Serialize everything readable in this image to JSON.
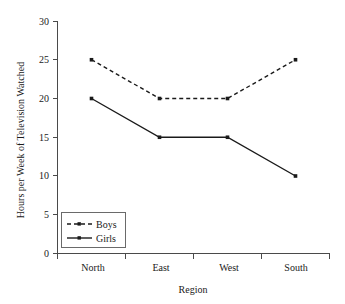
{
  "chart_data": {
    "type": "line",
    "title": "",
    "xlabel": "Region",
    "ylabel": "Hours per Week of Television Watched",
    "categories": [
      "North",
      "East",
      "West",
      "South"
    ],
    "series": [
      {
        "name": "Boys",
        "values": [
          25,
          20,
          20,
          25
        ],
        "style": "dashed",
        "marker": "square",
        "color": "#1a1a1a"
      },
      {
        "name": "Girls",
        "values": [
          20,
          15,
          15,
          10
        ],
        "style": "solid",
        "marker": "square",
        "color": "#1a1a1a"
      }
    ],
    "ylim": [
      0,
      30
    ],
    "yticks": [
      0,
      5,
      10,
      15,
      20,
      25,
      30
    ],
    "ytick_labels": [
      "0",
      "5",
      "10",
      "15",
      "20",
      "25",
      "30"
    ],
    "grid": false,
    "legend_position": "lower left"
  },
  "axis": {
    "y_label": "Hours per Week of Television Watched",
    "x_label": "Region",
    "y_ticks": [
      "30",
      "25",
      "20",
      "15",
      "10",
      "5",
      "0"
    ],
    "x_ticks": [
      "North",
      "East",
      "West",
      "South"
    ]
  },
  "legend": {
    "entries": [
      {
        "label": "Boys"
      },
      {
        "label": "Girls"
      }
    ]
  },
  "colors": {
    "background": "#ffffff",
    "axis": "#4a4a4a",
    "ink": "#1a1a1a",
    "legend_border": "#6a6a6a"
  }
}
